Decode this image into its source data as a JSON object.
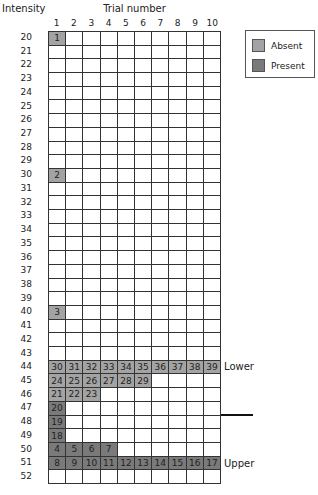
{
  "chart_data": {
    "type": "table",
    "title": "",
    "xlabel": "Trial number",
    "ylabel": "Intensity",
    "x_ticks": [
      "1",
      "2",
      "3",
      "4",
      "5",
      "6",
      "7",
      "8",
      "9",
      "10"
    ],
    "y_ticks": [
      "20",
      "21",
      "22",
      "23",
      "24",
      "25",
      "26",
      "27",
      "28",
      "29",
      "30",
      "31",
      "32",
      "33",
      "34",
      "35",
      "36",
      "37",
      "38",
      "39",
      "40",
      "41",
      "42",
      "43",
      "44",
      "45",
      "46",
      "47",
      "48",
      "49",
      "50",
      "51",
      "52"
    ],
    "legend": [
      {
        "label": "Absent",
        "color": "#a3a3a3"
      },
      {
        "label": "Present",
        "color": "#7a7a7a"
      }
    ],
    "cells": [
      {
        "intensity": 20,
        "col": 1,
        "trial": 1,
        "response": "absent"
      },
      {
        "intensity": 30,
        "col": 1,
        "trial": 2,
        "response": "absent"
      },
      {
        "intensity": 40,
        "col": 1,
        "trial": 3,
        "response": "absent"
      },
      {
        "intensity": 50,
        "col": 1,
        "trial": 4,
        "response": "present"
      },
      {
        "intensity": 50,
        "col": 2,
        "trial": 5,
        "response": "present"
      },
      {
        "intensity": 50,
        "col": 3,
        "trial": 6,
        "response": "present"
      },
      {
        "intensity": 50,
        "col": 4,
        "trial": 7,
        "response": "present"
      },
      {
        "intensity": 51,
        "col": 1,
        "trial": 8,
        "response": "present"
      },
      {
        "intensity": 51,
        "col": 2,
        "trial": 9,
        "response": "present"
      },
      {
        "intensity": 51,
        "col": 3,
        "trial": 10,
        "response": "present"
      },
      {
        "intensity": 51,
        "col": 4,
        "trial": 11,
        "response": "present"
      },
      {
        "intensity": 51,
        "col": 5,
        "trial": 12,
        "response": "present"
      },
      {
        "intensity": 51,
        "col": 6,
        "trial": 13,
        "response": "present"
      },
      {
        "intensity": 51,
        "col": 7,
        "trial": 14,
        "response": "present"
      },
      {
        "intensity": 51,
        "col": 8,
        "trial": 15,
        "response": "present"
      },
      {
        "intensity": 51,
        "col": 9,
        "trial": 16,
        "response": "present"
      },
      {
        "intensity": 51,
        "col": 10,
        "trial": 17,
        "response": "present"
      },
      {
        "intensity": 49,
        "col": 1,
        "trial": 18,
        "response": "present"
      },
      {
        "intensity": 48,
        "col": 1,
        "trial": 19,
        "response": "present"
      },
      {
        "intensity": 47,
        "col": 1,
        "trial": 20,
        "response": "present"
      },
      {
        "intensity": 46,
        "col": 1,
        "trial": 21,
        "response": "absent"
      },
      {
        "intensity": 46,
        "col": 2,
        "trial": 22,
        "response": "absent"
      },
      {
        "intensity": 46,
        "col": 3,
        "trial": 23,
        "response": "absent"
      },
      {
        "intensity": 45,
        "col": 1,
        "trial": 24,
        "response": "absent"
      },
      {
        "intensity": 45,
        "col": 2,
        "trial": 25,
        "response": "absent"
      },
      {
        "intensity": 45,
        "col": 3,
        "trial": 26,
        "response": "absent"
      },
      {
        "intensity": 45,
        "col": 4,
        "trial": 27,
        "response": "absent"
      },
      {
        "intensity": 45,
        "col": 5,
        "trial": 28,
        "response": "absent"
      },
      {
        "intensity": 45,
        "col": 6,
        "trial": 29,
        "response": "absent"
      },
      {
        "intensity": 44,
        "col": 1,
        "trial": 30,
        "response": "absent"
      },
      {
        "intensity": 44,
        "col": 2,
        "trial": 31,
        "response": "absent"
      },
      {
        "intensity": 44,
        "col": 3,
        "trial": 32,
        "response": "absent"
      },
      {
        "intensity": 44,
        "col": 4,
        "trial": 33,
        "response": "absent"
      },
      {
        "intensity": 44,
        "col": 5,
        "trial": 34,
        "response": "absent"
      },
      {
        "intensity": 44,
        "col": 6,
        "trial": 35,
        "response": "absent"
      },
      {
        "intensity": 44,
        "col": 7,
        "trial": 36,
        "response": "absent"
      },
      {
        "intensity": 44,
        "col": 8,
        "trial": 37,
        "response": "absent"
      },
      {
        "intensity": 44,
        "col": 9,
        "trial": 38,
        "response": "absent"
      },
      {
        "intensity": 44,
        "col": 10,
        "trial": 39,
        "response": "absent"
      }
    ],
    "row_annotations": [
      {
        "intensity": 44,
        "label": "Lower"
      },
      {
        "intensity": 51,
        "label": "Upper"
      }
    ],
    "threshold_marker": {
      "between": [
        47,
        48
      ]
    }
  }
}
